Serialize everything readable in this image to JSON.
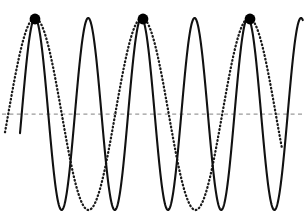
{
  "figure": {
    "background_color": "#ffffff",
    "width": 305,
    "height": 222
  },
  "colors": {
    "solid_curve": "#111111",
    "dotted_curve": "#1a1a1a",
    "baseline": "#9a9a9a",
    "marker": "#000000",
    "background": "#ffffff"
  },
  "chart_data": {
    "type": "line",
    "title": "",
    "xlabel": "",
    "ylabel": "",
    "xlim": [
      0,
      305
    ],
    "ylim": [
      222,
      0
    ],
    "grid": false,
    "legend": "none",
    "baseline": {
      "label": "zero-axis",
      "y_pixel": 114,
      "x_start": 2,
      "x_end": 303,
      "style": "dashed",
      "color": "#9a9a9a"
    },
    "series": [
      {
        "name": "solid-wave",
        "style": "solid",
        "color": "#111111",
        "amplitude_px": 96,
        "period_px": 53.2,
        "phase_peak_px": 35,
        "x_start": 20,
        "x_end": 303,
        "baseline_y": 114,
        "peak_y": 18,
        "trough_y": 213,
        "peaks_x": [
          35,
          88,
          143,
          196,
          250
        ],
        "troughs_x": [
          62,
          115,
          168,
          222,
          277
        ],
        "peak_count": 5,
        "trough_count": 5
      },
      {
        "name": "dotted-wave",
        "style": "dotted",
        "color": "#1a1a1a",
        "amplitude_px": 96,
        "period_px": 107,
        "phase_peak_px": 35,
        "x_start": 5,
        "x_end": 282,
        "baseline_y": 114,
        "peak_y": 18,
        "trough_y": 210,
        "peaks_x": [
          35,
          143,
          250
        ],
        "troughs_x": [
          88,
          196
        ],
        "peak_count": 3,
        "trough_count": 2
      }
    ],
    "markers": {
      "name": "coincident-peak-markers",
      "shape": "filled-circle",
      "color": "#000000",
      "radius_px": 5.4,
      "count": 3,
      "points": [
        {
          "x": 35,
          "y": 19
        },
        {
          "x": 143,
          "y": 19
        },
        {
          "x": 250,
          "y": 19
        }
      ]
    }
  }
}
